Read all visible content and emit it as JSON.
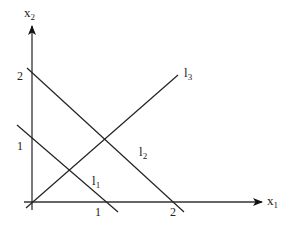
{
  "diagram": {
    "type": "coordinate-plane-lines",
    "axes": {
      "x_axis": {
        "label": "x",
        "subscript": "1"
      },
      "y_axis": {
        "label": "x",
        "subscript": "2"
      }
    },
    "ticks": {
      "x": [
        {
          "label": "1",
          "value": 1
        },
        {
          "label": "2",
          "value": 2
        }
      ],
      "y": [
        {
          "label": "1",
          "value": 1
        },
        {
          "label": "2",
          "value": 2
        }
      ]
    },
    "lines": [
      {
        "name": "l",
        "subscript": "1",
        "description": "decreasing line through (0,1) and (1,0)"
      },
      {
        "name": "l",
        "subscript": "2",
        "description": "decreasing line through (0,2) and (2,0)"
      },
      {
        "name": "l",
        "subscript": "3",
        "description": "increasing line through origin"
      }
    ],
    "colors": {
      "line": "#222222",
      "background": "#ffffff"
    }
  }
}
